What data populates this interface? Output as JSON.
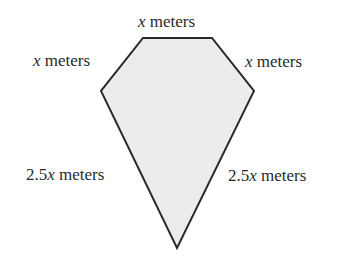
{
  "diagram": {
    "type": "kite-shaped pentagon",
    "fill_color": "#ececec",
    "stroke_color": "#2a2a2a",
    "vertices": {
      "top_left": [
        143,
        38
      ],
      "top_right": [
        212,
        38
      ],
      "right": [
        254,
        91
      ],
      "bottom": [
        177,
        248
      ],
      "left": [
        101,
        91
      ]
    },
    "labels": {
      "top": {
        "var": "x",
        "unit": " meters"
      },
      "upper_left": {
        "var": "x",
        "unit": " meters"
      },
      "upper_right": {
        "var": "x",
        "unit": " meters"
      },
      "lower_left": {
        "coef": "2.5",
        "var": "x",
        "unit": " meters"
      },
      "lower_right": {
        "coef": "2.5",
        "var": "x",
        "unit": " meters"
      }
    }
  }
}
